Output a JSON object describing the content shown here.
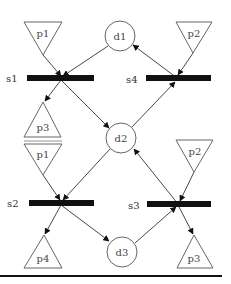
{
  "diagram": {
    "type": "petri-net",
    "colors": {
      "stroke": "#333333",
      "bar": "#111111",
      "background": "#ffffff"
    },
    "places": {
      "d1": {
        "label": "d1"
      },
      "d2": {
        "label": "d2"
      },
      "d3": {
        "label": "d3"
      }
    },
    "resources": [
      {
        "id": "p1_top",
        "label": "p1"
      },
      {
        "id": "p2_top",
        "label": "p2"
      },
      {
        "id": "p3_mid",
        "label": "p3"
      },
      {
        "id": "p1_mid",
        "label": "p1"
      },
      {
        "id": "p2_mid",
        "label": "p2"
      },
      {
        "id": "p4_bot",
        "label": "p4"
      },
      {
        "id": "p3_bot",
        "label": "p3"
      }
    ],
    "transitions": {
      "s1": {
        "label": "s1"
      },
      "s2": {
        "label": "s2"
      },
      "s3": {
        "label": "s3"
      },
      "s4": {
        "label": "s4"
      }
    },
    "edges": [
      {
        "from": "p1",
        "to": "s1"
      },
      {
        "from": "d1",
        "to": "s1"
      },
      {
        "from": "s1",
        "to": "p3"
      },
      {
        "from": "s1",
        "to": "d2"
      },
      {
        "from": "p2",
        "to": "s4"
      },
      {
        "from": "s4",
        "to": "d1"
      },
      {
        "from": "d2",
        "to": "s4"
      },
      {
        "from": "p1",
        "to": "s2"
      },
      {
        "from": "d2",
        "to": "s2"
      },
      {
        "from": "s2",
        "to": "p4"
      },
      {
        "from": "s2",
        "to": "d3"
      },
      {
        "from": "p2",
        "to": "s3"
      },
      {
        "from": "s3",
        "to": "d2"
      },
      {
        "from": "d3",
        "to": "s3"
      },
      {
        "from": "s3",
        "to": "p3"
      }
    ]
  }
}
